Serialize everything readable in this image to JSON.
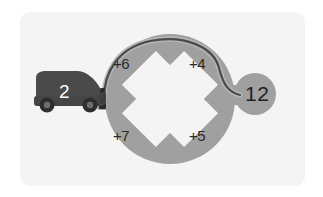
{
  "scene": {
    "kind": "roundabout-navigation-diagram",
    "card_bg": "#f4f4f4",
    "page_bg": "#ffffff"
  },
  "colors": {
    "road": "#a0a0a0",
    "road_shadow": "#9a9a9a",
    "cutout": "#f4f4f4",
    "vehicle_body": "#4a4a4a",
    "vehicle_body_dark": "#3f3f3f",
    "wheel": "#2e2e2e",
    "wheel_hub": "#6b6b6b",
    "route_path": "#4a4a4a",
    "label_text": "#2b2b2b",
    "vehicle_label_text": "#ffffff",
    "destination_text": "#1f1f1f",
    "marker": "#2a2a2a"
  },
  "vehicle": {
    "icon": "car-icon",
    "label": "2",
    "direction": "eastbound"
  },
  "roundabout": {
    "icon": "roundabout-icon",
    "center": {
      "x": 170,
      "y": 99
    },
    "outer_radius": 65,
    "inner_radius": 47,
    "exits": [
      {
        "position": "top-left",
        "label": "+6"
      },
      {
        "position": "top-right",
        "label": "+4"
      },
      {
        "position": "bottom-left",
        "label": "+7"
      },
      {
        "position": "bottom-right",
        "label": "+5"
      }
    ]
  },
  "destination": {
    "icon": "destination-node-icon",
    "label": "12",
    "center": {
      "x": 255,
      "y": 94
    },
    "radius": 21
  },
  "route": {
    "icon": "route-path-icon",
    "description": "enters roundabout at west, travels over the top, exits east toward destination"
  },
  "entry_marker": {
    "icon": "entry-marker-icon"
  }
}
